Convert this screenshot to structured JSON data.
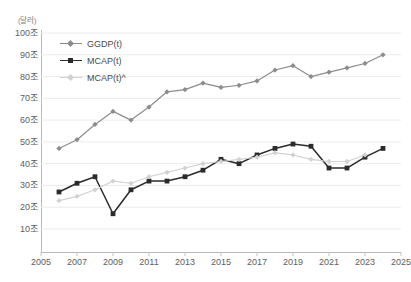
{
  "chart_data": {
    "type": "line",
    "title": "",
    "unit_label": "(달러)",
    "xlabel": "",
    "ylabel": "",
    "xlim": [
      2005,
      2025
    ],
    "ylim": [
      0,
      100
    ],
    "grid": true,
    "legend_position": "top-left-inside",
    "x_tick_labels": [
      "2005",
      "2007",
      "2009",
      "2011",
      "2013",
      "2015",
      "2017",
      "2019",
      "2021",
      "2023",
      "2025"
    ],
    "y_tick_labels": [
      "10조",
      "20조",
      "30조",
      "40조",
      "50조",
      "60조",
      "70조",
      "80조",
      "90조",
      "100조"
    ],
    "y_tick_values": [
      10,
      20,
      30,
      40,
      50,
      60,
      70,
      80,
      90,
      100
    ],
    "x": [
      2006,
      2007,
      2008,
      2009,
      2010,
      2011,
      2012,
      2013,
      2014,
      2015,
      2016,
      2017,
      2018,
      2019,
      2020,
      2021,
      2022,
      2023,
      2024
    ],
    "series": [
      {
        "name": "GGDP(t)",
        "color": "#8c8c8c",
        "marker": "diamond",
        "values": [
          47,
          51,
          58,
          64,
          60,
          66,
          73,
          74,
          77,
          75,
          76,
          78,
          83,
          85,
          80,
          82,
          84,
          86,
          90
        ]
      },
      {
        "name": "MCAP(t)",
        "color": "#2b2b2b",
        "marker": "square",
        "values": [
          27,
          31,
          34,
          17,
          28,
          32,
          32,
          34,
          37,
          42,
          40,
          44,
          47,
          49,
          48,
          38,
          38,
          43,
          47
        ]
      },
      {
        "name": "MCAP(t)^",
        "color": "#d2d2d2",
        "marker": "diamond",
        "values": [
          23,
          25,
          28,
          32,
          31,
          34,
          36,
          38,
          40,
          41,
          42,
          43,
          45,
          44,
          42,
          41,
          41,
          44,
          null
        ]
      }
    ]
  },
  "legend": {
    "items": [
      {
        "label": "GGDP(t)"
      },
      {
        "label": "MCAP(t)"
      },
      {
        "label": "MCAP(t)^"
      }
    ]
  }
}
